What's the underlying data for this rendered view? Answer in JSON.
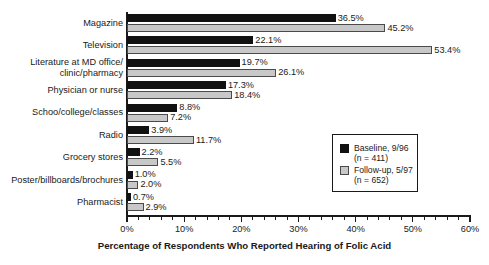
{
  "chart_data": {
    "type": "bar",
    "orientation": "horizontal",
    "title": "",
    "subtitle": "",
    "xlabel": "Percentage of Respondents Who Reported Hearing of Folic Acid",
    "ylabel": "",
    "xlim": [
      0,
      60
    ],
    "xtick_labels": [
      "0%",
      "10%",
      "20%",
      "30%",
      "40%",
      "50%",
      "60%"
    ],
    "xtick_values": [
      0,
      10,
      20,
      30,
      40,
      50,
      60
    ],
    "xtick_minor_step": 2,
    "grid": false,
    "legend_position": "center-right",
    "value_label_suffix": "%",
    "categories": [
      "Magazine",
      "Television",
      "Literature at MD office/\nclinic/pharmacy",
      "Physician or nurse",
      "Schoo/college/classes",
      "Radio",
      "Grocery stores",
      "Poster/billboards/brochures",
      "Pharmacist"
    ],
    "series": [
      {
        "name": "Baseline, 9/96",
        "n": 411,
        "color": "#111111",
        "values": [
          36.5,
          22.1,
          19.7,
          17.3,
          8.8,
          3.9,
          2.2,
          1.0,
          0.7
        ],
        "value_labels": [
          "36.5%",
          "22.1%",
          "19.7%",
          "17.3%",
          "8.8%",
          "3.9%",
          "2.2%",
          "1.0%",
          "0.7%"
        ]
      },
      {
        "name": "Follow-up, 5/97",
        "n": 652,
        "color": "#c8c8c8",
        "values": [
          45.2,
          53.4,
          26.1,
          18.4,
          7.2,
          11.7,
          5.5,
          2.0,
          2.9
        ],
        "value_labels": [
          "45.2%",
          "53.4%",
          "26.1%",
          "18.4%",
          "7.2%",
          "11.7%",
          "5.5%",
          "2.0%",
          "2.9%"
        ]
      }
    ]
  },
  "legend": {
    "entries": [
      {
        "label": "Baseline, 9/96\n(n = 411)",
        "swatch": "baseline"
      },
      {
        "label": "Follow-up, 5/97\n(n = 652)",
        "swatch": "followup"
      }
    ]
  },
  "axis": {
    "x_title": "Percentage of Respondents Who Reported Hearing of Folic Acid"
  }
}
